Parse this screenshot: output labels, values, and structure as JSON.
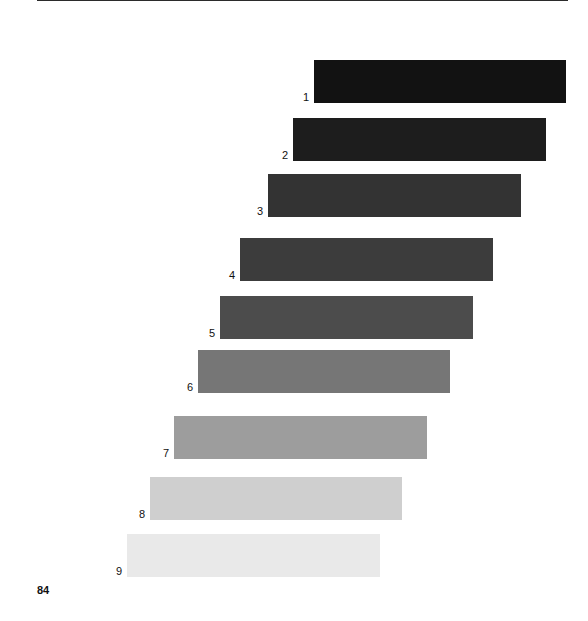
{
  "page": {
    "number": "84",
    "background_color": "#ffffff",
    "rule_color": "#1a1a1a"
  },
  "chart_data": {
    "type": "bar",
    "orientation": "horizontal",
    "title": "",
    "subtitle": "",
    "xlabel": "",
    "ylabel": "",
    "grid": false,
    "legend": "none",
    "note": "Nine horizontal bars of equal length arranged in a descending staircase, shaded from near-black (top) to near-white (bottom); three horizontal rules divide them into three groups of three.",
    "categories": [
      "1",
      "2",
      "3",
      "4",
      "5",
      "6",
      "7",
      "8",
      "9"
    ],
    "values": [
      253,
      253,
      253,
      253,
      253,
      253,
      253,
      253,
      253
    ],
    "x_start": [
      314,
      293,
      268,
      240,
      220,
      198,
      174,
      150,
      127
    ],
    "x_end": [
      566,
      546,
      521,
      493,
      473,
      450,
      427,
      402,
      380
    ],
    "bar_colors": [
      "#121212",
      "#1d1d1d",
      "#333333",
      "#3c3c3c",
      "#4c4c4c",
      "#767676",
      "#9d9d9d",
      "#cfcfcf",
      "#e9e9e9"
    ],
    "group_separators": [
      3,
      6
    ],
    "xlim": [
      127,
      566
    ]
  },
  "bars": [
    {
      "label": "1",
      "left": 314,
      "width": 252,
      "top": 60,
      "color": "#121212"
    },
    {
      "label": "2",
      "left": 293,
      "width": 253,
      "top": 118,
      "color": "#1d1d1d"
    },
    {
      "label": "3",
      "left": 268,
      "width": 253,
      "top": 174,
      "color": "#333333"
    },
    {
      "label": "4",
      "left": 240,
      "width": 253,
      "top": 238,
      "color": "#3c3c3c"
    },
    {
      "label": "5",
      "left": 220,
      "width": 253,
      "top": 296,
      "color": "#4c4c4c"
    },
    {
      "label": "6",
      "left": 198,
      "width": 252,
      "top": 350,
      "color": "#767676"
    },
    {
      "label": "7",
      "left": 174,
      "width": 253,
      "top": 416,
      "color": "#9d9d9d"
    },
    {
      "label": "8",
      "left": 150,
      "width": 252,
      "top": 477,
      "color": "#cfcfcf"
    },
    {
      "label": "9",
      "left": 127,
      "width": 253,
      "top": 534,
      "color": "#e9e9e9"
    }
  ],
  "rules": [
    {
      "name": "top-rule",
      "top": 44
    },
    {
      "name": "middle-rule",
      "top": 226
    },
    {
      "name": "lower-rule",
      "top": 403
    },
    {
      "name": "footer-rule",
      "top": 581
    }
  ]
}
